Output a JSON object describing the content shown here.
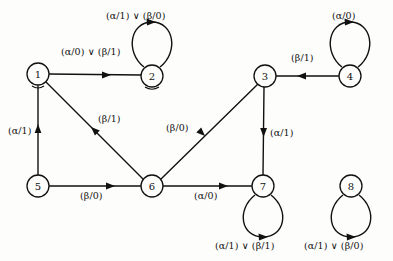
{
  "diagram": {
    "type": "state-transition-diagram",
    "title": "",
    "background_color": "#fdfdfb",
    "ink_color": "#111111",
    "nodes": [
      {
        "id": "1",
        "label": "1",
        "cx": 38,
        "cy": 74,
        "r": 11
      },
      {
        "id": "2",
        "label": "2",
        "cx": 152,
        "cy": 76,
        "r": 11
      },
      {
        "id": "3",
        "label": "3",
        "cx": 265,
        "cy": 76,
        "r": 11
      },
      {
        "id": "4",
        "label": "4",
        "cx": 350,
        "cy": 76,
        "r": 11
      },
      {
        "id": "5",
        "label": "5",
        "cx": 38,
        "cy": 186,
        "r": 11
      },
      {
        "id": "6",
        "label": "6",
        "cx": 152,
        "cy": 186,
        "r": 11
      },
      {
        "id": "7",
        "label": "7",
        "cx": 263,
        "cy": 186,
        "r": 11
      },
      {
        "id": "8",
        "label": "8",
        "cx": 351,
        "cy": 186,
        "r": 11
      }
    ],
    "edges": [
      {
        "from": "1",
        "to": "2",
        "label": "(α/0) ∨ (β/1)",
        "terms": [
          "(α/0)",
          "(β/1)"
        ],
        "label_x": 61,
        "label_y": 46
      },
      {
        "from": "4",
        "to": "3",
        "label": "(β/1)",
        "terms": [
          "(β/1)"
        ],
        "label_x": 291,
        "label_y": 52
      },
      {
        "from": "5",
        "to": "1",
        "label": "(α/1)",
        "terms": [
          "(α/1)"
        ],
        "label_x": 8,
        "label_y": 125
      },
      {
        "from": "6",
        "to": "1",
        "label": "(β/1)",
        "terms": [
          "(β/1)"
        ],
        "label_x": 98,
        "label_y": 113
      },
      {
        "from": "6",
        "to": "3",
        "label": "(β/0)",
        "terms": [
          "(β/0)"
        ],
        "label_x": 166,
        "label_y": 122
      },
      {
        "from": "3",
        "to": "7",
        "label": "(α/1)",
        "terms": [
          "(α/1)"
        ],
        "label_x": 270,
        "label_y": 127
      },
      {
        "from": "5",
        "to": "6",
        "label": "(β/0)",
        "terms": [
          "(β/0)"
        ],
        "label_x": 80,
        "label_y": 190
      },
      {
        "from": "6",
        "to": "7",
        "label": "(α/0)",
        "terms": [
          "(α/0)"
        ],
        "label_x": 194,
        "label_y": 190
      }
    ],
    "self_loops": [
      {
        "node": "2",
        "label": "(α/1) ∨ (β/0)",
        "terms": [
          "(α/1)",
          "(β/0)"
        ],
        "position": "above",
        "label_x": 106,
        "label_y": 10
      },
      {
        "node": "4",
        "label": "(α/0)",
        "terms": [
          "(α/0)"
        ],
        "position": "above",
        "label_x": 332,
        "label_y": 10
      },
      {
        "node": "7",
        "label": "(α/1) ∨ (β/1)",
        "terms": [
          "(α/1)",
          "(β/1)"
        ],
        "position": "below",
        "label_x": 215,
        "label_y": 240
      },
      {
        "node": "8",
        "label": "(α/1) ∨ (β/0)",
        "terms": [
          "(α/1)",
          "(β/0)"
        ],
        "position": "below",
        "label_x": 304,
        "label_y": 240
      }
    ],
    "symbols": {
      "or": "∨",
      "alpha": "α",
      "beta": "β"
    }
  }
}
